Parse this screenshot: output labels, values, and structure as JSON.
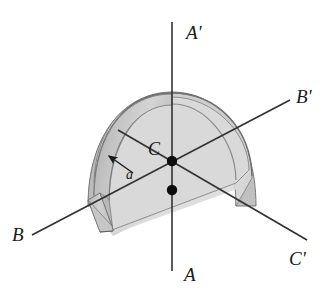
{
  "figure": {
    "kind": "3d-geometry-diagram",
    "background_color": "#ffffff"
  },
  "axes": [
    {
      "id": "axis-a",
      "name": "vertical-axis",
      "negative_label": "A",
      "positive_label": "A'",
      "negative_label_x": 184,
      "negative_label_y": 281,
      "positive_label_x": 186,
      "positive_label_y": 39,
      "x1": 172,
      "y1": 22,
      "x2": 172,
      "y2": 271,
      "color": "#333333"
    },
    {
      "id": "axis-b",
      "name": "horizontal-depth-axis",
      "negative_label": "B",
      "positive_label": "B'",
      "negative_label_x": 12,
      "negative_label_y": 241,
      "positive_label_x": 296,
      "positive_label_y": 103,
      "x1": 32,
      "y1": 235,
      "x2": 290,
      "y2": 100,
      "color": "#333333"
    },
    {
      "id": "axis-c",
      "name": "diagonal-axis",
      "negative_label": "C",
      "positive_label": "C'",
      "negative_label_x": 148,
      "negative_label_y": 155,
      "positive_label_x": 289,
      "positive_label_y": 265,
      "x1": 118,
      "y1": 130,
      "x2": 307,
      "y2": 240,
      "color": "#333333"
    }
  ],
  "points": [
    {
      "id": "center-point",
      "name": "center-C",
      "x": 172,
      "y": 161,
      "r": 5,
      "color": "#0d0d0d"
    },
    {
      "id": "base-point",
      "name": "base-intersection",
      "x": 172,
      "y": 190,
      "r": 5,
      "color": "#0d0d0d"
    }
  ],
  "dimension": {
    "label": "a",
    "label_x": 126,
    "label_y": 178,
    "arrow_tail_x": 131,
    "arrow_tail_y": 172,
    "arrow_head_x": 107,
    "arrow_head_y": 155,
    "color": "#1a1a1a"
  },
  "shell": {
    "name": "hemispherical-shell",
    "center_x": 172,
    "center_y": 190,
    "outer_radius_x": 84,
    "outer_radius_y": 97,
    "inner_radius_x": 75,
    "inner_radius_y": 88,
    "outer_fill": "#c9c9c9",
    "inner_face_fill": "#d6d6d6",
    "rim_fill": "#bdbdbd",
    "cut_wall_fill": "#cfcfcf",
    "equator_plane_fill": "#d2d2d2",
    "stroke": "#5a5a5a",
    "top_y": 93,
    "left_x": 88,
    "right_x": 252,
    "bottom_y": 231
  },
  "colors": {
    "ink": "#1a1a1a",
    "line": "#333333",
    "shade_light": "#dcdcdc",
    "shade_mid": "#c9c9c9",
    "shade_dark": "#b0b0b0"
  }
}
